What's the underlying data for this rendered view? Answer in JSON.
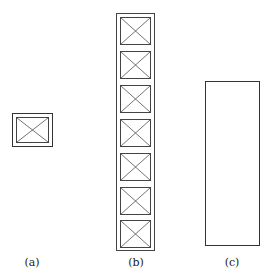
{
  "figure": {
    "panels": [
      {
        "id": "a",
        "label": "(a)",
        "description": "single cell with crossed diagonals"
      },
      {
        "id": "b",
        "label": "(b)",
        "description": "vertical stack of 7 crossed cells",
        "cell_count": 7
      },
      {
        "id": "c",
        "label": "(c)",
        "description": "plain tall rectangle"
      }
    ],
    "colors": {
      "stroke": "#333333",
      "background": "#ffffff"
    }
  }
}
